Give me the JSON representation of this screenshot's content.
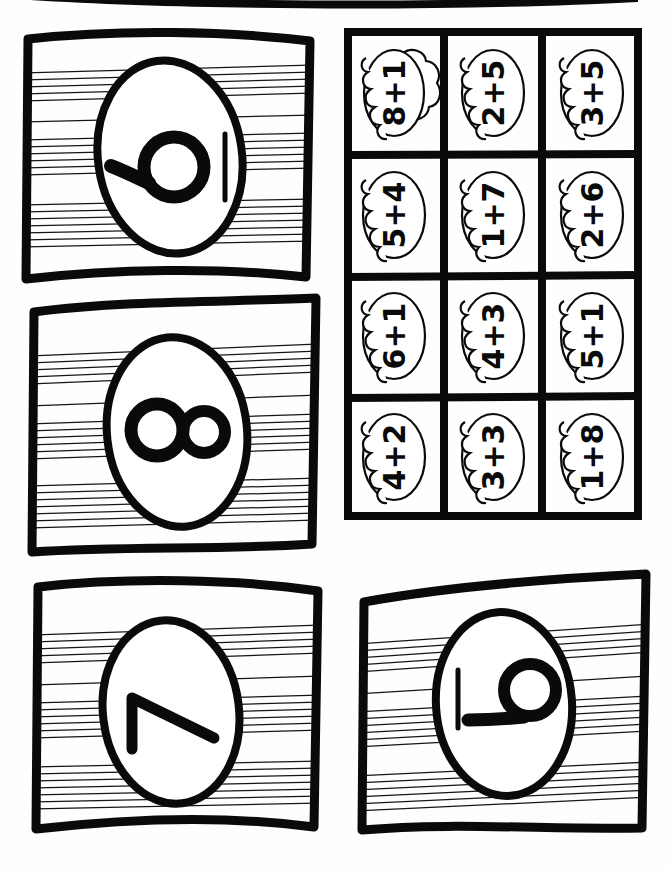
{
  "document": {
    "title": "Egg Math Fact Cards Cut-Out Worksheet",
    "page_background": "#ffffff",
    "ink_color": "#0a0a0a",
    "hatch_color": "#111111"
  },
  "top_cut_strip": {
    "label": "partial card edge cut off at top of page",
    "visible": true
  },
  "number_cards": [
    {
      "id": "card-top-left",
      "value": "10",
      "glyph_kind": "one-and-circle",
      "order": "circle-left-bar-right",
      "x": 18,
      "y": 27,
      "width": 300,
      "height": 262
    },
    {
      "id": "card-middle-left",
      "value": "8",
      "glyph_kind": "eight",
      "order": "single",
      "x": 22,
      "y": 294,
      "width": 302,
      "height": 262
    },
    {
      "id": "card-bottom-left",
      "value": "7",
      "glyph_kind": "seven",
      "order": "single",
      "x": 28,
      "y": 577,
      "width": 300,
      "height": 262
    },
    {
      "id": "card-bottom-right",
      "value": "10",
      "glyph_kind": "one-and-circle",
      "order": "bar-left-circle-right",
      "x": 352,
      "y": 572,
      "width": 302,
      "height": 262
    }
  ],
  "fact_grid": {
    "x": 344,
    "y": 28,
    "width": 298,
    "height": 492,
    "rows": 4,
    "columns": 3,
    "border_color": "#0a0a0a",
    "cell_shape": "cloud-outline",
    "cells": [
      {
        "row": 1,
        "col": 1,
        "text": "8+1",
        "a": 8,
        "b": 1,
        "sum": 9
      },
      {
        "row": 1,
        "col": 2,
        "text": "2+5",
        "a": 2,
        "b": 5,
        "sum": 7
      },
      {
        "row": 1,
        "col": 3,
        "text": "3+5",
        "a": 3,
        "b": 5,
        "sum": 8
      },
      {
        "row": 2,
        "col": 1,
        "text": "5+4",
        "a": 5,
        "b": 4,
        "sum": 9
      },
      {
        "row": 2,
        "col": 2,
        "text": "1+7",
        "a": 1,
        "b": 7,
        "sum": 8
      },
      {
        "row": 2,
        "col": 3,
        "text": "2+6",
        "a": 2,
        "b": 6,
        "sum": 8
      },
      {
        "row": 3,
        "col": 1,
        "text": "6+1",
        "a": 6,
        "b": 1,
        "sum": 7
      },
      {
        "row": 3,
        "col": 2,
        "text": "4+3",
        "a": 4,
        "b": 3,
        "sum": 7
      },
      {
        "row": 3,
        "col": 3,
        "text": "5+1",
        "a": 5,
        "b": 1,
        "sum": 6
      },
      {
        "row": 4,
        "col": 1,
        "text": "4+2",
        "a": 4,
        "b": 2,
        "sum": 6
      },
      {
        "row": 4,
        "col": 2,
        "text": "3+3",
        "a": 3,
        "b": 3,
        "sum": 6
      },
      {
        "row": 4,
        "col": 3,
        "text": "1+8",
        "a": 1,
        "b": 8,
        "sum": 9
      }
    ]
  }
}
